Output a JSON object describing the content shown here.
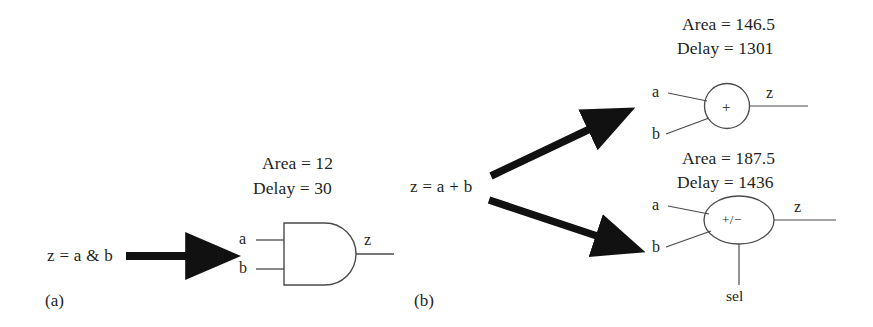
{
  "figure": {
    "caption_a": "(a)",
    "caption_b": "(b)"
  },
  "part_a": {
    "expression": "z = a & b",
    "arrow": "thick-right-arrow",
    "gate": {
      "kind": "and-gate",
      "operator": "",
      "inputs": [
        "a",
        "b"
      ],
      "output": "z",
      "metrics": {
        "area_label": "Area = 12",
        "delay_label": "Delay = 30",
        "area_value": 12,
        "delay_value": 30
      }
    }
  },
  "part_b": {
    "expression": "z = a + b",
    "branches": [
      {
        "arrow": "thick-up-right-arrow",
        "gate": {
          "kind": "adder",
          "shape": "circle",
          "operator": "+",
          "inputs": [
            "a",
            "b"
          ],
          "output": "z",
          "metrics": {
            "area_label": "Area = 146.5",
            "delay_label": "Delay = 1301",
            "area_value": 146.5,
            "delay_value": 1301
          }
        }
      },
      {
        "arrow": "thick-down-right-arrow",
        "gate": {
          "kind": "adder-subtractor",
          "shape": "ellipse",
          "operator": "+/−",
          "inputs": [
            "a",
            "b",
            "sel"
          ],
          "output": "z",
          "metrics": {
            "area_label": "Area = 187.5",
            "delay_label": "Delay = 1436",
            "area_value": 187.5,
            "delay_value": 1436
          }
        }
      }
    ]
  },
  "colors": {
    "ink": "#231f20",
    "line": "#3a3a3a",
    "background": "#ffffff"
  }
}
